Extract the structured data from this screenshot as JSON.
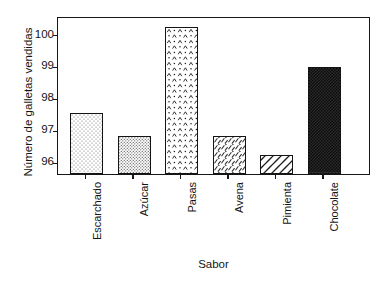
{
  "chart_data": {
    "type": "bar",
    "title": "",
    "xlabel": "Sabor",
    "ylabel": "Número de galletas vendidas",
    "categories": [
      "Escarchado",
      "Azúcar",
      "Pasas",
      "Avena",
      "Pimienta",
      "Chocolate"
    ],
    "values": [
      97.5,
      96.8,
      100.2,
      96.8,
      96.2,
      98.95
    ],
    "ylim": [
      95.6,
      100.55
    ],
    "yticks": [
      96,
      97,
      98,
      99,
      100
    ],
    "ytick_labels": [
      "96",
      "97",
      "98",
      "99",
      "100"
    ],
    "grid": false,
    "legend": false,
    "legend_position": "none",
    "bar_fills": [
      "light-stipple",
      "medium-stipple",
      "caret-dots",
      "scribble-hatch",
      "diagonal-hatch",
      "dark-dense"
    ],
    "colors": {
      "axis": "#161616",
      "bar_outline": "#141414",
      "background": "#ffffff",
      "text": "#141414"
    }
  }
}
